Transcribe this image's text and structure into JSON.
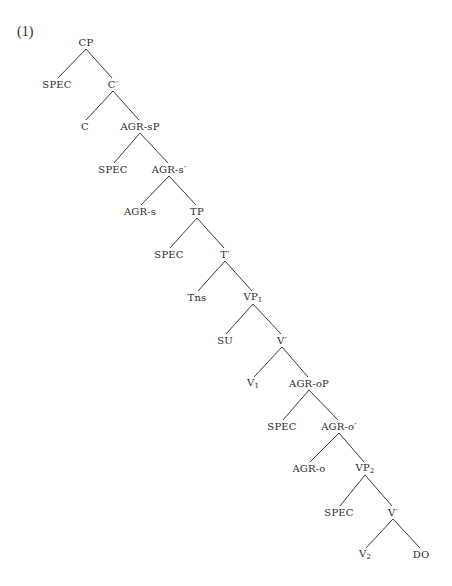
{
  "example_number": "(1)",
  "tree": {
    "nodes": [
      {
        "id": "cp",
        "label": "CP",
        "sub": "",
        "prime": false,
        "x": 86,
        "y": 43
      },
      {
        "id": "spec1",
        "label": "SPEC",
        "sub": "",
        "prime": false,
        "x": 57,
        "y": 85
      },
      {
        "id": "cbar",
        "label": "C",
        "sub": "",
        "prime": true,
        "x": 113,
        "y": 85
      },
      {
        "id": "c",
        "label": "C",
        "sub": "",
        "prime": false,
        "x": 85,
        "y": 127
      },
      {
        "id": "agrsp",
        "label": "AGR-sP",
        "sub": "",
        "prime": false,
        "x": 140,
        "y": 127
      },
      {
        "id": "spec2",
        "label": "SPEC",
        "sub": "",
        "prime": false,
        "x": 113,
        "y": 170
      },
      {
        "id": "agrsbar",
        "label": "AGR-s",
        "sub": "",
        "prime": true,
        "x": 169,
        "y": 170
      },
      {
        "id": "agrs",
        "label": "AGR-s",
        "sub": "",
        "prime": false,
        "x": 140,
        "y": 212
      },
      {
        "id": "tp",
        "label": "TP",
        "sub": "",
        "prime": false,
        "x": 197,
        "y": 212
      },
      {
        "id": "spec3",
        "label": "SPEC",
        "sub": "",
        "prime": false,
        "x": 169,
        "y": 255
      },
      {
        "id": "tbar",
        "label": "T",
        "sub": "",
        "prime": true,
        "x": 225,
        "y": 255
      },
      {
        "id": "tns",
        "label": "Tns",
        "sub": "",
        "prime": false,
        "x": 197,
        "y": 298
      },
      {
        "id": "vp1",
        "label": "VP",
        "sub": "1",
        "prime": false,
        "x": 253,
        "y": 298
      },
      {
        "id": "su",
        "label": "SU",
        "sub": "",
        "prime": false,
        "x": 225,
        "y": 341
      },
      {
        "id": "vbar1",
        "label": "V",
        "sub": "",
        "prime": true,
        "x": 282,
        "y": 341
      },
      {
        "id": "v1",
        "label": "V",
        "sub": "1",
        "prime": false,
        "x": 253,
        "y": 384
      },
      {
        "id": "agrop",
        "label": "AGR-oP",
        "sub": "",
        "prime": false,
        "x": 309,
        "y": 384
      },
      {
        "id": "spec4",
        "label": "SPEC",
        "sub": "",
        "prime": false,
        "x": 282,
        "y": 427
      },
      {
        "id": "agrobar",
        "label": "AGR-o",
        "sub": "",
        "prime": true,
        "x": 339,
        "y": 427
      },
      {
        "id": "agro",
        "label": "AGR-o",
        "sub": "",
        "prime": false,
        "x": 309,
        "y": 469
      },
      {
        "id": "vp2",
        "label": "VP",
        "sub": "2",
        "prime": false,
        "x": 365,
        "y": 469
      },
      {
        "id": "spec5",
        "label": "SPEC",
        "sub": "",
        "prime": false,
        "x": 339,
        "y": 513
      },
      {
        "id": "vbar2",
        "label": "V",
        "sub": "",
        "prime": true,
        "x": 393,
        "y": 513
      },
      {
        "id": "v2",
        "label": "V",
        "sub": "2",
        "prime": false,
        "x": 365,
        "y": 555
      },
      {
        "id": "do",
        "label": "DO",
        "sub": "",
        "prime": false,
        "x": 421,
        "y": 555
      }
    ],
    "edges": [
      [
        "cp",
        "spec1"
      ],
      [
        "cp",
        "cbar"
      ],
      [
        "cbar",
        "c"
      ],
      [
        "cbar",
        "agrsp"
      ],
      [
        "agrsp",
        "spec2"
      ],
      [
        "agrsp",
        "agrsbar"
      ],
      [
        "agrsbar",
        "agrs"
      ],
      [
        "agrsbar",
        "tp"
      ],
      [
        "tp",
        "spec3"
      ],
      [
        "tp",
        "tbar"
      ],
      [
        "tbar",
        "tns"
      ],
      [
        "tbar",
        "vp1"
      ],
      [
        "vp1",
        "su"
      ],
      [
        "vp1",
        "vbar1"
      ],
      [
        "vbar1",
        "v1"
      ],
      [
        "vbar1",
        "agrop"
      ],
      [
        "agrop",
        "spec4"
      ],
      [
        "agrop",
        "agrobar"
      ],
      [
        "agrobar",
        "agro"
      ],
      [
        "agrobar",
        "vp2"
      ],
      [
        "vp2",
        "spec5"
      ],
      [
        "vp2",
        "vbar2"
      ],
      [
        "vbar2",
        "v2"
      ],
      [
        "vbar2",
        "do"
      ]
    ]
  }
}
